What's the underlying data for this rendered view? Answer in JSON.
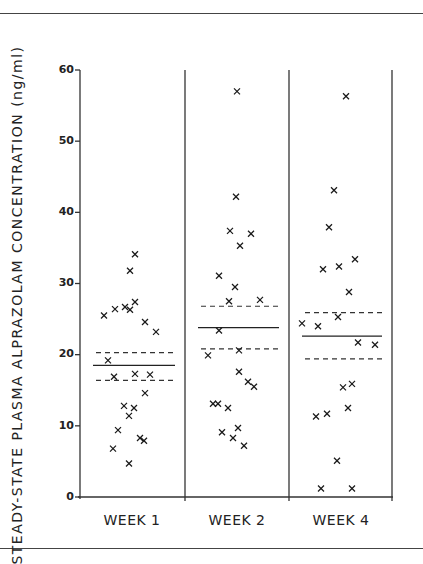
{
  "chart_data": {
    "type": "scatter",
    "title": "",
    "xlabel": "",
    "ylabel": "STEADY-STATE PLASMA ALPRAZOLAM CONCENTRATION (ng/ml)",
    "ylim": [
      0,
      60
    ],
    "yticks": [
      0,
      10,
      20,
      30,
      40,
      50,
      60
    ],
    "categories": [
      "WEEK 1",
      "WEEK 2",
      "WEEK 4"
    ],
    "grid": false,
    "legend": null,
    "marker": "x",
    "series": [
      {
        "name": "WEEK 1",
        "mean": 18.5,
        "upper_ci": 20.3,
        "lower_ci": 16.4,
        "points": [
          {
            "x": 135,
            "v": 34.1
          },
          {
            "x": 130,
            "v": 31.8
          },
          {
            "x": 135,
            "v": 27.4
          },
          {
            "x": 125,
            "v": 26.7
          },
          {
            "x": 115,
            "v": 26.4
          },
          {
            "x": 130,
            "v": 26.3
          },
          {
            "x": 104,
            "v": 25.5
          },
          {
            "x": 145,
            "v": 24.6
          },
          {
            "x": 156,
            "v": 23.2
          },
          {
            "x": 108,
            "v": 19.2
          },
          {
            "x": 135,
            "v": 17.3
          },
          {
            "x": 150,
            "v": 17.2
          },
          {
            "x": 114,
            "v": 16.9
          },
          {
            "x": 145,
            "v": 14.6
          },
          {
            "x": 124,
            "v": 12.8
          },
          {
            "x": 134,
            "v": 12.5
          },
          {
            "x": 129,
            "v": 11.4
          },
          {
            "x": 118,
            "v": 9.4
          },
          {
            "x": 140,
            "v": 8.3
          },
          {
            "x": 144,
            "v": 7.9
          },
          {
            "x": 113,
            "v": 6.8
          },
          {
            "x": 129,
            "v": 4.7
          }
        ]
      },
      {
        "name": "WEEK 2",
        "mean": 23.8,
        "upper_ci": 26.8,
        "lower_ci": 20.8,
        "points": [
          {
            "x": 237,
            "v": 57.0
          },
          {
            "x": 236,
            "v": 42.2
          },
          {
            "x": 230,
            "v": 37.4
          },
          {
            "x": 251,
            "v": 37.0
          },
          {
            "x": 240,
            "v": 35.3
          },
          {
            "x": 219,
            "v": 31.1
          },
          {
            "x": 235,
            "v": 29.5
          },
          {
            "x": 260,
            "v": 27.7
          },
          {
            "x": 229,
            "v": 27.5
          },
          {
            "x": 219,
            "v": 23.4
          },
          {
            "x": 239,
            "v": 20.6
          },
          {
            "x": 208,
            "v": 19.9
          },
          {
            "x": 239,
            "v": 17.6
          },
          {
            "x": 248,
            "v": 16.2
          },
          {
            "x": 254,
            "v": 15.5
          },
          {
            "x": 213,
            "v": 13.1
          },
          {
            "x": 218,
            "v": 13.1
          },
          {
            "x": 228,
            "v": 12.5
          },
          {
            "x": 238,
            "v": 9.7
          },
          {
            "x": 222,
            "v": 9.1
          },
          {
            "x": 233,
            "v": 8.3
          },
          {
            "x": 244,
            "v": 7.2
          }
        ]
      },
      {
        "name": "WEEK 4",
        "mean": 22.6,
        "upper_ci": 25.9,
        "lower_ci": 19.4,
        "points": [
          {
            "x": 346,
            "v": 56.3
          },
          {
            "x": 334,
            "v": 43.1
          },
          {
            "x": 329,
            "v": 37.9
          },
          {
            "x": 355,
            "v": 33.4
          },
          {
            "x": 339,
            "v": 32.4
          },
          {
            "x": 323,
            "v": 32.0
          },
          {
            "x": 349,
            "v": 28.8
          },
          {
            "x": 338,
            "v": 25.3
          },
          {
            "x": 302,
            "v": 24.4
          },
          {
            "x": 318,
            "v": 24.0
          },
          {
            "x": 358,
            "v": 21.7
          },
          {
            "x": 375,
            "v": 21.4
          },
          {
            "x": 352,
            "v": 15.9
          },
          {
            "x": 343,
            "v": 15.4
          },
          {
            "x": 348,
            "v": 12.5
          },
          {
            "x": 327,
            "v": 11.7
          },
          {
            "x": 316,
            "v": 11.3
          },
          {
            "x": 337,
            "v": 5.1
          },
          {
            "x": 321,
            "v": 1.2
          },
          {
            "x": 352,
            "v": 1.2
          }
        ]
      }
    ]
  },
  "axis": {
    "ylabel": "STEADY-STATE PLASMA ALPRAZOLAM CONCENTRATION (ng/ml)",
    "tick_labels": [
      "0",
      "10",
      "20",
      "30",
      "40",
      "50",
      "60"
    ],
    "category_labels": [
      "WEEK 1",
      "WEEK 2",
      "WEEK 4"
    ]
  },
  "colors": {
    "ink": "#1a1a1a",
    "axis": "#333333",
    "background": "#ffffff"
  }
}
